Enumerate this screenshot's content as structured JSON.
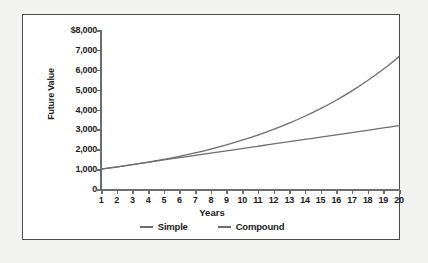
{
  "chart_data": {
    "type": "line",
    "title": "",
    "xlabel": "Years",
    "ylabel": "Future Value",
    "x": [
      1,
      2,
      3,
      4,
      5,
      6,
      7,
      8,
      9,
      10,
      11,
      12,
      13,
      14,
      15,
      16,
      17,
      18,
      19,
      20
    ],
    "xlim": [
      1,
      20
    ],
    "ylim": [
      0,
      8000
    ],
    "grid": false,
    "legend_position": "bottom-center",
    "y_tick_labels": [
      "$8,000",
      "7,000",
      "6,000",
      "5,000",
      "4,000",
      "3,000",
      "2,000",
      "1,000",
      "0"
    ],
    "y_tick_values": [
      8000,
      7000,
      6000,
      5000,
      4000,
      3000,
      2000,
      1000,
      0
    ],
    "x_tick_labels": [
      "1",
      "2",
      "3",
      "4",
      "5",
      "6",
      "7",
      "8",
      "9",
      "10",
      "11",
      "12",
      "13",
      "14",
      "15",
      "16",
      "17",
      "18",
      "19",
      "20"
    ],
    "series": [
      {
        "name": "Simple",
        "color": "#6d6d6d",
        "values": [
          1000,
          1115,
          1230,
          1345,
          1460,
          1575,
          1690,
          1805,
          1920,
          2035,
          2150,
          2265,
          2380,
          2495,
          2610,
          2725,
          2840,
          2955,
          3070,
          3185
        ]
      },
      {
        "name": "Compound",
        "color": "#6d6d6d",
        "values": [
          1000,
          1105,
          1221,
          1349,
          1491,
          1647,
          1820,
          2011,
          2222,
          2455,
          2713,
          2998,
          3312,
          3660,
          4044,
          4468,
          4937,
          5455,
          6027,
          6660
        ]
      }
    ]
  },
  "legend": {
    "items": [
      {
        "label": "Simple"
      },
      {
        "label": "Compound"
      }
    ]
  },
  "axes": {
    "y_title": "Future Value",
    "x_title": "Years"
  }
}
